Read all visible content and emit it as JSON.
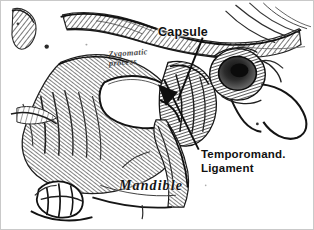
{
  "figure": {
    "kind": "anatomical-engraving",
    "width_px": 314,
    "height_px": 230,
    "background_color": "#ffffff",
    "border_color": "#c9c9c9",
    "ink_color": "#111111"
  },
  "labels": {
    "capsule": "Capsule",
    "temporomandibular_ligament": {
      "line1": "Temporomand.",
      "line2": "Ligament"
    },
    "mandible": "Mandible",
    "zygomatic_process": {
      "line1": "Zygomatic",
      "line2": "process"
    }
  },
  "leader_lines": [
    {
      "name": "capsule-leader",
      "from_label": "Capsule",
      "points": "203,37 178,100"
    },
    {
      "name": "temporomandibular-ligament-leader",
      "from_label": "Temporomand. Ligament",
      "points": "199,150 164,79"
    }
  ],
  "drawing_regions": [
    {
      "name": "zygomatic-arch",
      "description": "hatched bone arch across upper left and center"
    },
    {
      "name": "mandibular-ramus",
      "description": "hatched bone mass at left and center-left"
    },
    {
      "name": "articular-disc-space",
      "description": "white lens-shaped void at center of joint"
    },
    {
      "name": "external-auditory-meatus",
      "description": "dark ring structure at right"
    },
    {
      "name": "ear-outline",
      "description": "curved contour line at far right"
    },
    {
      "name": "teeth",
      "description": "molar crowns at lower left"
    },
    {
      "name": "condylar-neck",
      "description": "vertical shaded column below joint"
    }
  ]
}
